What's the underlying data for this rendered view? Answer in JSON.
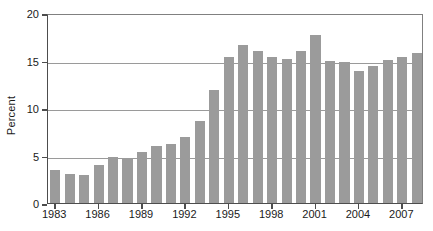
{
  "chart_data": {
    "type": "bar",
    "title": "",
    "subtitle": "",
    "xlabel": "",
    "ylabel": "Percent",
    "ylim": [
      0,
      20
    ],
    "yticks": [
      0,
      5,
      10,
      15,
      20
    ],
    "ytick_labels": [
      "0",
      "5",
      "10",
      "15",
      "20"
    ],
    "grid": true,
    "grid_axis": "y",
    "legend": false,
    "legend_position": "none",
    "bar_color": "#9b9b9b",
    "axis_color": "#4d4d4d",
    "grid_color": "#9a9a9a",
    "text_color": "#1a1a1a",
    "categories": [
      "1983",
      "1984",
      "1985",
      "1986",
      "1987",
      "1988",
      "1989",
      "1990",
      "1991",
      "1992",
      "1993",
      "1994",
      "1995",
      "1996",
      "1997",
      "1998",
      "1999",
      "2000",
      "2001",
      "2002",
      "2003",
      "2004",
      "2005",
      "2006",
      "2007",
      "2008"
    ],
    "values": [
      3.5,
      3.1,
      3.0,
      4.0,
      4.8,
      4.7,
      5.4,
      6.0,
      6.2,
      6.9,
      8.6,
      11.9,
      15.4,
      16.6,
      16.0,
      15.4,
      15.2,
      16.0,
      17.7,
      14.9,
      14.8,
      13.9,
      14.4,
      15.1,
      15.4,
      15.8
    ],
    "xtick_labels": [
      "1983",
      "1986",
      "1989",
      "1992",
      "1995",
      "1998",
      "2001",
      "2004",
      "2007"
    ],
    "xtick_categories": [
      "1983",
      "1986",
      "1989",
      "1992",
      "1995",
      "1998",
      "2001",
      "2004",
      "2007"
    ]
  }
}
